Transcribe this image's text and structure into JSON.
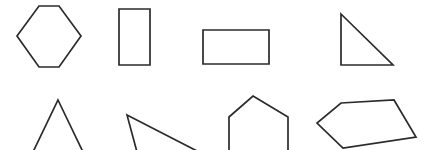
{
  "canvas": {
    "width": 426,
    "height": 150,
    "background_color": "#ffffff",
    "stroke_color": "#2b2b2b",
    "stroke_width": 1.7,
    "fill": "none",
    "rows": 2,
    "columns": 4,
    "shape_count": 8
  },
  "shapes": [
    {
      "id": "hexagon",
      "name": "hexagon",
      "row": 1,
      "column": 1,
      "sides": 6,
      "clipped": false,
      "orientation": "flat-top-left-right-vertices",
      "points": "39,6 59,6 81,36 59,67 39,67 17,36"
    },
    {
      "id": "rectangle-vertical",
      "name": "vertical-rectangle",
      "row": 1,
      "column": 2,
      "sides": 4,
      "clipped": false,
      "orientation": "portrait",
      "points": "119,9 150,9 150,65 119,65"
    },
    {
      "id": "rectangle-wide",
      "name": "wide-rectangle",
      "row": 1,
      "column": 3,
      "sides": 4,
      "clipped": false,
      "orientation": "landscape",
      "points": "203,30 269,30 269,64 203,64"
    },
    {
      "id": "right-triangle",
      "name": "right-triangle",
      "row": 1,
      "column": 4,
      "sides": 3,
      "clipped": false,
      "orientation": "right-angle-bottom-left",
      "points": "341,14 393,65 341,65"
    },
    {
      "id": "isosceles-triangle",
      "name": "isosceles-triangle",
      "row": 2,
      "column": 1,
      "sides": 3,
      "clipped": true,
      "orientation": "apex-up",
      "points": "58,100 83,152 33,152"
    },
    {
      "id": "scalene-triangle",
      "name": "scalene-triangle",
      "row": 2,
      "column": 2,
      "sides": 3,
      "clipped": true,
      "orientation": "apex-upper-left",
      "points": "127,115 199,152 137,152"
    },
    {
      "id": "pentagon-upright",
      "name": "upright-pentagon",
      "row": 2,
      "column": 3,
      "sides": 5,
      "clipped": true,
      "orientation": "apex-up",
      "points": "253,96 288,117 288,152 229,152 229,117"
    },
    {
      "id": "pentagon-rotated",
      "name": "rotated-pentagon",
      "row": 2,
      "column": 4,
      "sides": 5,
      "clipped": false,
      "orientation": "tilted",
      "points": "341,103 394,100 416,137 343,148 317,123"
    }
  ]
}
